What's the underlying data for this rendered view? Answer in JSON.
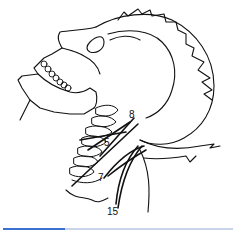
{
  "figure": {
    "labels": [
      {
        "id": "label-8",
        "text": "8",
        "x": 129,
        "y": 115
      },
      {
        "id": "label-5",
        "text": "5",
        "x": 104,
        "y": 143
      },
      {
        "id": "label-7",
        "text": "7",
        "x": 98,
        "y": 178
      },
      {
        "id": "label-15",
        "text": "15",
        "x": 109,
        "y": 212
      }
    ],
    "line_color": "#111111",
    "background": "#ffffff"
  },
  "progress": {
    "percent": 27,
    "fill_color": "#3b6fd1",
    "track_color": "#c9d3ea"
  }
}
